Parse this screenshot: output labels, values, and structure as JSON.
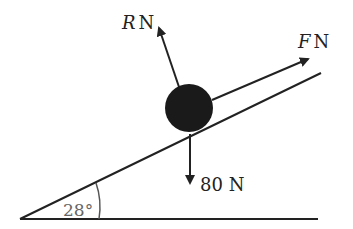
{
  "diagram": {
    "type": "inclined-plane-force-diagram",
    "angle_label": "28°",
    "forces": {
      "normal": {
        "symbol": "R",
        "unit": "N"
      },
      "applied": {
        "symbol": "F",
        "unit": "N"
      },
      "weight": {
        "label": "80 N"
      }
    },
    "colors": {
      "line": "#222222",
      "ball": "#1a1a1a",
      "angle_text": "#666666"
    }
  }
}
